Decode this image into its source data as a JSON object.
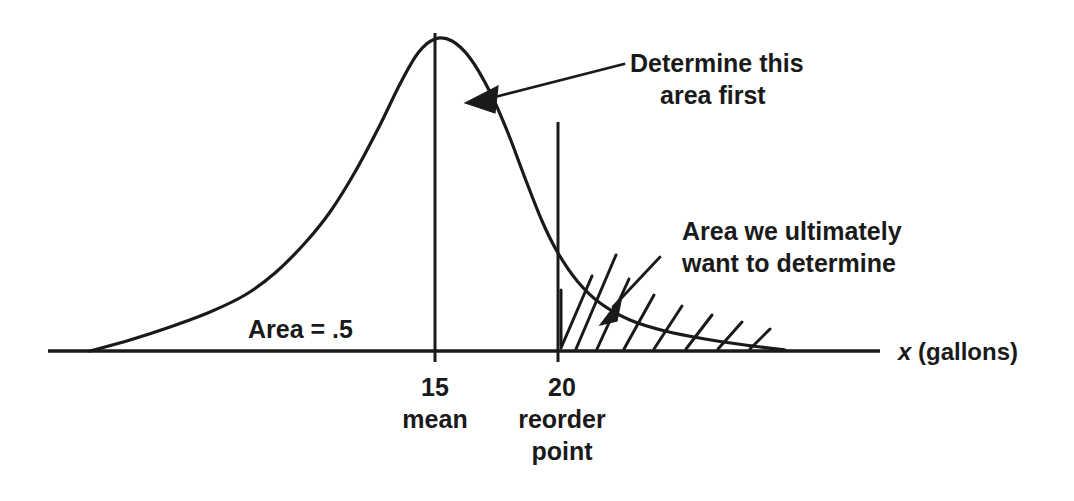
{
  "figure": {
    "ink_color": "#1a1a1a",
    "background_color": "#ffffff"
  },
  "annotations": {
    "left_area": {
      "label": "Area = .5",
      "x": 248,
      "y": 338
    },
    "top_callout": {
      "line1": "Determine this",
      "line2": "area first",
      "x": 630,
      "y1": 72,
      "y2": 104
    },
    "right_callout": {
      "line1": "Area we ultimately",
      "line2": "want to determine",
      "x": 682,
      "y1": 240,
      "y2": 272
    }
  },
  "axis": {
    "label_x": "x",
    "label_units": " (gallons)",
    "label_full": "x (gallons)",
    "y": 351,
    "x_start": 48,
    "x_end": 880
  },
  "ticks": [
    {
      "value": "15",
      "caption_line1": "mean",
      "caption_line2": "",
      "x": 435
    },
    {
      "value": "20",
      "caption_line1": "reorder",
      "caption_line2": "point",
      "x": 558
    }
  ],
  "chart_data": {
    "type": "line",
    "title": "",
    "xlabel": "x (gallons)",
    "ylabel": "",
    "distribution": "normal-like density curve (right-skewed tail)",
    "mean": 15,
    "reorder_point": 20,
    "xlim": [
      0,
      40
    ],
    "ylim": [
      0,
      1
    ],
    "regions": [
      {
        "name": "left-of-mean",
        "from": "-inf",
        "to": 15,
        "area": 0.5,
        "label": "Area = .5",
        "shaded": false
      },
      {
        "name": "mean-to-reorder-point",
        "from": 15,
        "to": 20,
        "label": "Determine this area first",
        "shaded": false
      },
      {
        "name": "right-tail",
        "from": 20,
        "to": "+inf",
        "label": "Area we ultimately want to determine",
        "shaded": true,
        "shading": "diagonal-hatch"
      }
    ],
    "curve_points": [
      {
        "x": 90,
        "y": 351
      },
      {
        "x": 130,
        "y": 340
      },
      {
        "x": 170,
        "y": 327
      },
      {
        "x": 210,
        "y": 312
      },
      {
        "x": 245,
        "y": 295
      },
      {
        "x": 275,
        "y": 273
      },
      {
        "x": 305,
        "y": 243
      },
      {
        "x": 330,
        "y": 212
      },
      {
        "x": 355,
        "y": 172
      },
      {
        "x": 380,
        "y": 125
      },
      {
        "x": 400,
        "y": 84
      },
      {
        "x": 418,
        "y": 53
      },
      {
        "x": 435,
        "y": 39
      },
      {
        "x": 452,
        "y": 41
      },
      {
        "x": 470,
        "y": 58
      },
      {
        "x": 490,
        "y": 92
      },
      {
        "x": 508,
        "y": 133
      },
      {
        "x": 525,
        "y": 178
      },
      {
        "x": 542,
        "y": 221
      },
      {
        "x": 558,
        "y": 253
      },
      {
        "x": 578,
        "y": 282
      },
      {
        "x": 600,
        "y": 303
      },
      {
        "x": 630,
        "y": 320
      },
      {
        "x": 665,
        "y": 331
      },
      {
        "x": 705,
        "y": 339
      },
      {
        "x": 745,
        "y": 345
      },
      {
        "x": 785,
        "y": 350
      }
    ]
  },
  "hatch_lines": [
    {
      "x1": 561,
      "y1": 345,
      "x2": 561,
      "y2": 290
    },
    {
      "x1": 561,
      "y1": 348,
      "x2": 592,
      "y2": 276
    },
    {
      "x1": 576,
      "y1": 349,
      "x2": 616,
      "y2": 255
    },
    {
      "x1": 597,
      "y1": 349,
      "x2": 629,
      "y2": 279
    },
    {
      "x1": 624,
      "y1": 349,
      "x2": 654,
      "y2": 295
    },
    {
      "x1": 654,
      "y1": 349,
      "x2": 682,
      "y2": 306
    },
    {
      "x1": 686,
      "y1": 349,
      "x2": 712,
      "y2": 315
    },
    {
      "x1": 718,
      "y1": 349,
      "x2": 742,
      "y2": 322
    },
    {
      "x1": 750,
      "y1": 349,
      "x2": 770,
      "y2": 329
    }
  ]
}
